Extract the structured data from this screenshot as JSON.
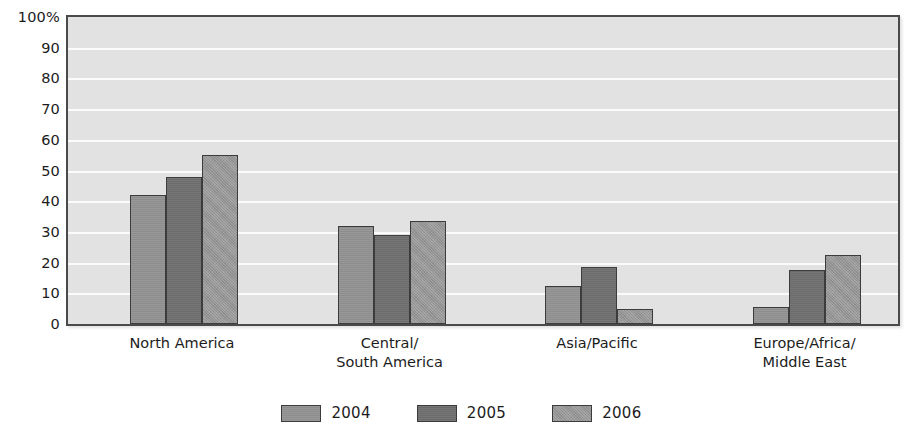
{
  "chart_data": {
    "type": "bar",
    "title": "",
    "subtitle": "",
    "xlabel": "",
    "ylabel": "",
    "ylim": [
      0,
      100
    ],
    "ytick_labels": [
      "100%",
      "90",
      "80",
      "70",
      "60",
      "50",
      "40",
      "30",
      "20",
      "10",
      "0"
    ],
    "ytick_values": [
      100,
      90,
      80,
      70,
      60,
      50,
      40,
      30,
      20,
      10,
      0
    ],
    "grid": true,
    "legend_position": "bottom",
    "categories": [
      "North America",
      "Central/\nSouth America",
      "Asia/Pacific",
      "Europe/Africa/\nMiddle East"
    ],
    "series": [
      {
        "name": "2004",
        "color": "#8d8d8d",
        "values": [
          42,
          32,
          12.5,
          5.5
        ]
      },
      {
        "name": "2005",
        "color": "#6b6b6b",
        "values": [
          48,
          29,
          18.5,
          17.5
        ]
      },
      {
        "name": "2006",
        "color": "#949494",
        "values": [
          55,
          33.5,
          5,
          22.5
        ]
      }
    ]
  },
  "legend": {
    "items": [
      {
        "label": "2004",
        "color": "#8d8d8d"
      },
      {
        "label": "2005",
        "color": "#6b6b6b"
      },
      {
        "label": "2006",
        "color": "#949494"
      }
    ]
  },
  "style": {
    "plot_background": "#e2e2e2",
    "gridline_color": "#fbfbfb",
    "frame_color": "#4a4a4a",
    "text_color": "#1c1c1c"
  }
}
